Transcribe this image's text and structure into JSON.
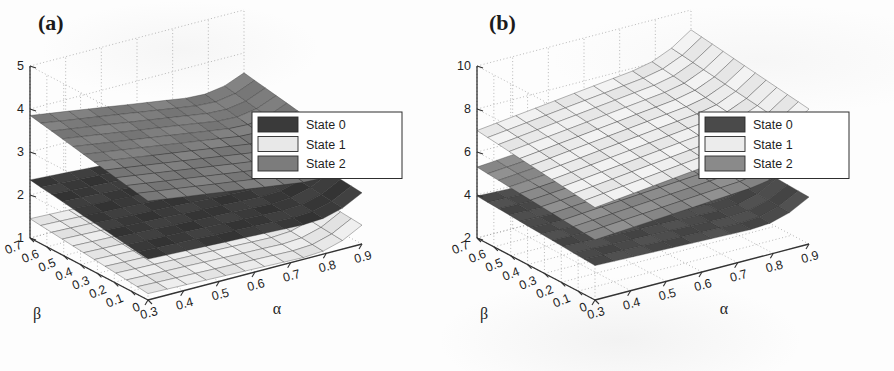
{
  "figure": {
    "background_color": "#fdfdfd",
    "panels": [
      {
        "id": "a",
        "label": "(a)",
        "chart_data": {
          "type": "surface3d",
          "title": "",
          "xlabel": "α",
          "ylabel": "β",
          "zlabel": "U_ISP",
          "zlabel_main": "U",
          "zlabel_sub": "ISP",
          "xticks": [
            "0.3",
            "0.4",
            "0.5",
            "0.6",
            "0.7",
            "0.8",
            "0.9"
          ],
          "xtick_values": [
            0.3,
            0.4,
            0.5,
            0.6,
            0.7,
            0.8,
            0.9
          ],
          "yticks": [
            "0.7",
            "0.6",
            "0.5",
            "0.4",
            "0.3",
            "0.2",
            "0.1",
            "0"
          ],
          "ytick_values": [
            0.7,
            0.6,
            0.5,
            0.4,
            0.3,
            0.2,
            0.1,
            0.0
          ],
          "zticks": [
            "1",
            "2",
            "3",
            "4",
            "5"
          ],
          "ztick_values": [
            1,
            2,
            3,
            4,
            5
          ],
          "xlim": [
            0.3,
            0.9
          ],
          "ylim": [
            0.0,
            0.7
          ],
          "zlim": [
            1,
            5
          ],
          "grid": true,
          "legend_position": "upper-right",
          "series": [
            {
              "name": "State 0",
              "color": "#3a3a3a",
              "z_at_corners": {
                "x_min_y_max": 2.35,
                "x_max_y_max": 2.05,
                "x_min_y_min": 1.95,
                "x_max_y_min": 1.75
              },
              "z_mean": 2.05
            },
            {
              "name": "State 1",
              "color": "#e8e8e8",
              "z_at_corners": {
                "x_min_y_max": 1.45,
                "x_max_y_max": 1.25,
                "x_min_y_min": 1.15,
                "x_max_y_min": 1.0
              },
              "z_mean": 1.2
            },
            {
              "name": "State 2",
              "color": "#7c7c7c",
              "z_at_corners": {
                "x_min_y_max": 3.85,
                "x_max_y_max": 3.1,
                "x_min_y_min": 3.3,
                "x_max_y_min": 2.6
              },
              "z_mean": 3.2
            }
          ]
        },
        "legend": [
          {
            "label": "State 0",
            "color": "#3a3a3a"
          },
          {
            "label": "State 1",
            "color": "#e8e8e8"
          },
          {
            "label": "State 2",
            "color": "#7c7c7c"
          }
        ]
      },
      {
        "id": "b",
        "label": "(b)",
        "chart_data": {
          "type": "surface3d",
          "title": "",
          "xlabel": "α",
          "ylabel": "β",
          "zlabel": "U_CP",
          "zlabel_main": "U",
          "zlabel_sub": "CP",
          "xticks": [
            "0.3",
            "0.4",
            "0.5",
            "0.6",
            "0.7",
            "0.8",
            "0.9"
          ],
          "xtick_values": [
            0.3,
            0.4,
            0.5,
            0.6,
            0.7,
            0.8,
            0.9
          ],
          "yticks": [
            "0.7",
            "0.6",
            "0.5",
            "0.4",
            "0.3",
            "0.2",
            "0.1",
            "0"
          ],
          "ytick_values": [
            0.7,
            0.6,
            0.5,
            0.4,
            0.3,
            0.2,
            0.1,
            0.0
          ],
          "zticks": [
            "2",
            "4",
            "6",
            "8",
            "10"
          ],
          "ztick_values": [
            2,
            4,
            6,
            8,
            10
          ],
          "xlim": [
            0.3,
            0.9
          ],
          "ylim": [
            0.0,
            0.7
          ],
          "zlim": [
            2,
            10
          ],
          "grid": true,
          "legend_position": "upper-right",
          "series": [
            {
              "name": "State 0",
              "color": "#4a4a4a",
              "z_at_corners": {
                "x_min_y_max": 3.95,
                "x_max_y_max": 3.6,
                "x_min_y_min": 3.6,
                "x_max_y_min": 3.3
              },
              "z_mean": 3.7
            },
            {
              "name": "State 1",
              "color": "#ececec",
              "z_at_corners": {
                "x_min_y_max": 7.0,
                "x_max_y_max": 8.2,
                "x_min_y_min": 6.3,
                "x_max_y_min": 7.4
              },
              "z_mean": 7.2
            },
            {
              "name": "State 2",
              "color": "#8a8a8a",
              "z_at_corners": {
                "x_min_y_max": 5.3,
                "x_max_y_max": 6.1,
                "x_min_y_min": 4.8,
                "x_max_y_min": 5.5
              },
              "z_mean": 5.4
            }
          ]
        },
        "legend": [
          {
            "label": "State 0",
            "color": "#4a4a4a"
          },
          {
            "label": "State 1",
            "color": "#ececec"
          },
          {
            "label": "State 2",
            "color": "#8a8a8a"
          }
        ]
      }
    ]
  }
}
